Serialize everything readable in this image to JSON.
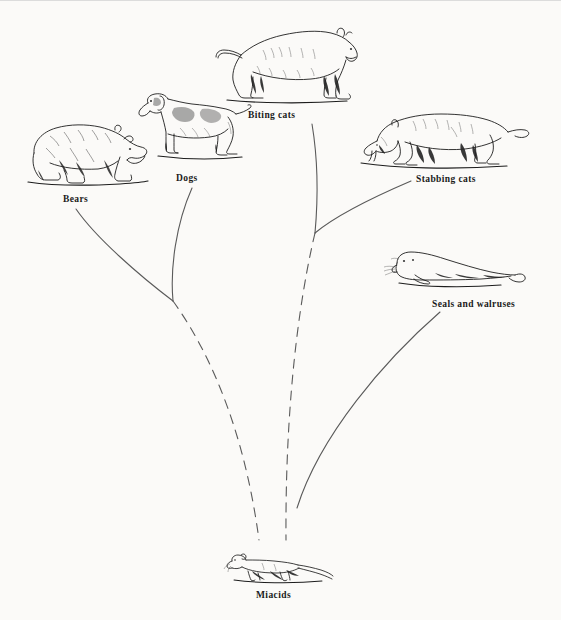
{
  "figure": {
    "type": "phylogenetic-tree-diagram",
    "background_color": "#fbfaf8",
    "line_color": "#5a5a5a",
    "ink_color": "#1a1a1a"
  },
  "nodes": [
    {
      "id": "bears",
      "label": "Bears",
      "icon": "bear-illustration",
      "label_x": 63,
      "label_y": 194,
      "art_x": 20,
      "art_y": 108,
      "art_w": 130,
      "art_h": 80
    },
    {
      "id": "dogs",
      "label": "Dogs",
      "icon": "dog-illustration",
      "label_x": 176,
      "label_y": 173,
      "art_x": 136,
      "art_y": 84,
      "art_w": 120,
      "art_h": 84
    },
    {
      "id": "biting-cats",
      "label": "Biting cats",
      "icon": "lion-illustration",
      "label_x": 248,
      "label_y": 110,
      "art_x": 213,
      "art_y": 22,
      "art_w": 148,
      "art_h": 82
    },
    {
      "id": "stabbing-cats",
      "label": "Stabbing cats",
      "icon": "sabertooth-cat-illustration",
      "label_x": 416,
      "label_y": 174,
      "art_x": 355,
      "art_y": 97,
      "art_w": 176,
      "art_h": 72
    },
    {
      "id": "seals-walruses",
      "label": "Seals and walruses",
      "icon": "seal-illustration",
      "label_x": 432,
      "label_y": 299,
      "art_x": 383,
      "art_y": 245,
      "art_w": 145,
      "art_h": 48
    },
    {
      "id": "miacids",
      "label": "Miacids",
      "icon": "miacid-illustration",
      "label_x": 256,
      "label_y": 590,
      "art_x": 222,
      "art_y": 549,
      "art_w": 114,
      "art_h": 36
    }
  ],
  "branches": [
    {
      "id": "branch-bears",
      "from": "bears",
      "style": "solid",
      "path": "M 76 209 C 96 238, 140 276, 173 301"
    },
    {
      "id": "branch-dogs",
      "from": "dogs",
      "style": "solid",
      "path": "M 192 188 C 176 224, 170 268, 173 301"
    },
    {
      "id": "branch-bears-dogs-stem",
      "from": "bears-dogs-junction",
      "style": "dashed",
      "path": "M 173 301 C 204 344, 243 420, 259 540"
    },
    {
      "id": "branch-biting-cats",
      "from": "biting-cats",
      "style": "solid",
      "path": "M 312 124 C 318 160, 318 200, 315 233"
    },
    {
      "id": "branch-stabbing-cats",
      "from": "stabbing-cats",
      "style": "solid",
      "path": "M 411 181 C 383 193, 340 212, 315 233"
    },
    {
      "id": "branch-cats-stem",
      "from": "cats-junction",
      "style": "dashed",
      "path": "M 315 233 C 300 296, 285 400, 286 540"
    },
    {
      "id": "branch-seals",
      "from": "seals-walruses",
      "style": "solid",
      "path": "M 440 312 C 385 360, 320 435, 297 508"
    }
  ]
}
